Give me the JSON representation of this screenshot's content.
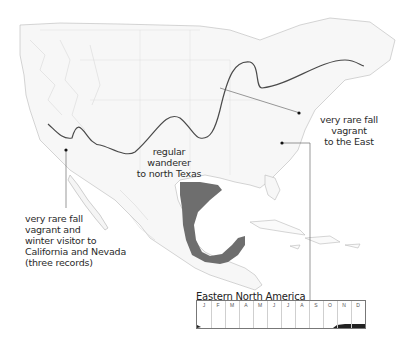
{
  "map": {
    "region": "North America",
    "range_color": "#6e6e6e",
    "boundary_line_color": "#4a4a4a"
  },
  "annotations": {
    "west": {
      "lines": [
        "very rare fall",
        "vagrant and",
        "winter visitor to",
        "California and Nevada",
        "(three records)"
      ]
    },
    "texas": {
      "lines": [
        "regular wanderer",
        "to north Texas"
      ]
    },
    "east": {
      "lines": [
        "very rare fall",
        "vagrant",
        "to the East"
      ]
    }
  },
  "chart": {
    "title": "Eastern North America",
    "months": [
      "J",
      "F",
      "M",
      "A",
      "M",
      "J",
      "J",
      "A",
      "S",
      "O",
      "N",
      "D"
    ]
  },
  "chart_data": {
    "type": "area",
    "title": "Eastern North America",
    "categories": [
      "J",
      "F",
      "M",
      "A",
      "M",
      "J",
      "J",
      "A",
      "S",
      "O",
      "N",
      "D"
    ],
    "values": [
      0.05,
      0,
      0,
      0,
      0,
      0,
      0,
      0,
      0,
      0,
      0.2,
      0.3
    ],
    "xlabel": "",
    "ylabel": "Abundance"
  }
}
